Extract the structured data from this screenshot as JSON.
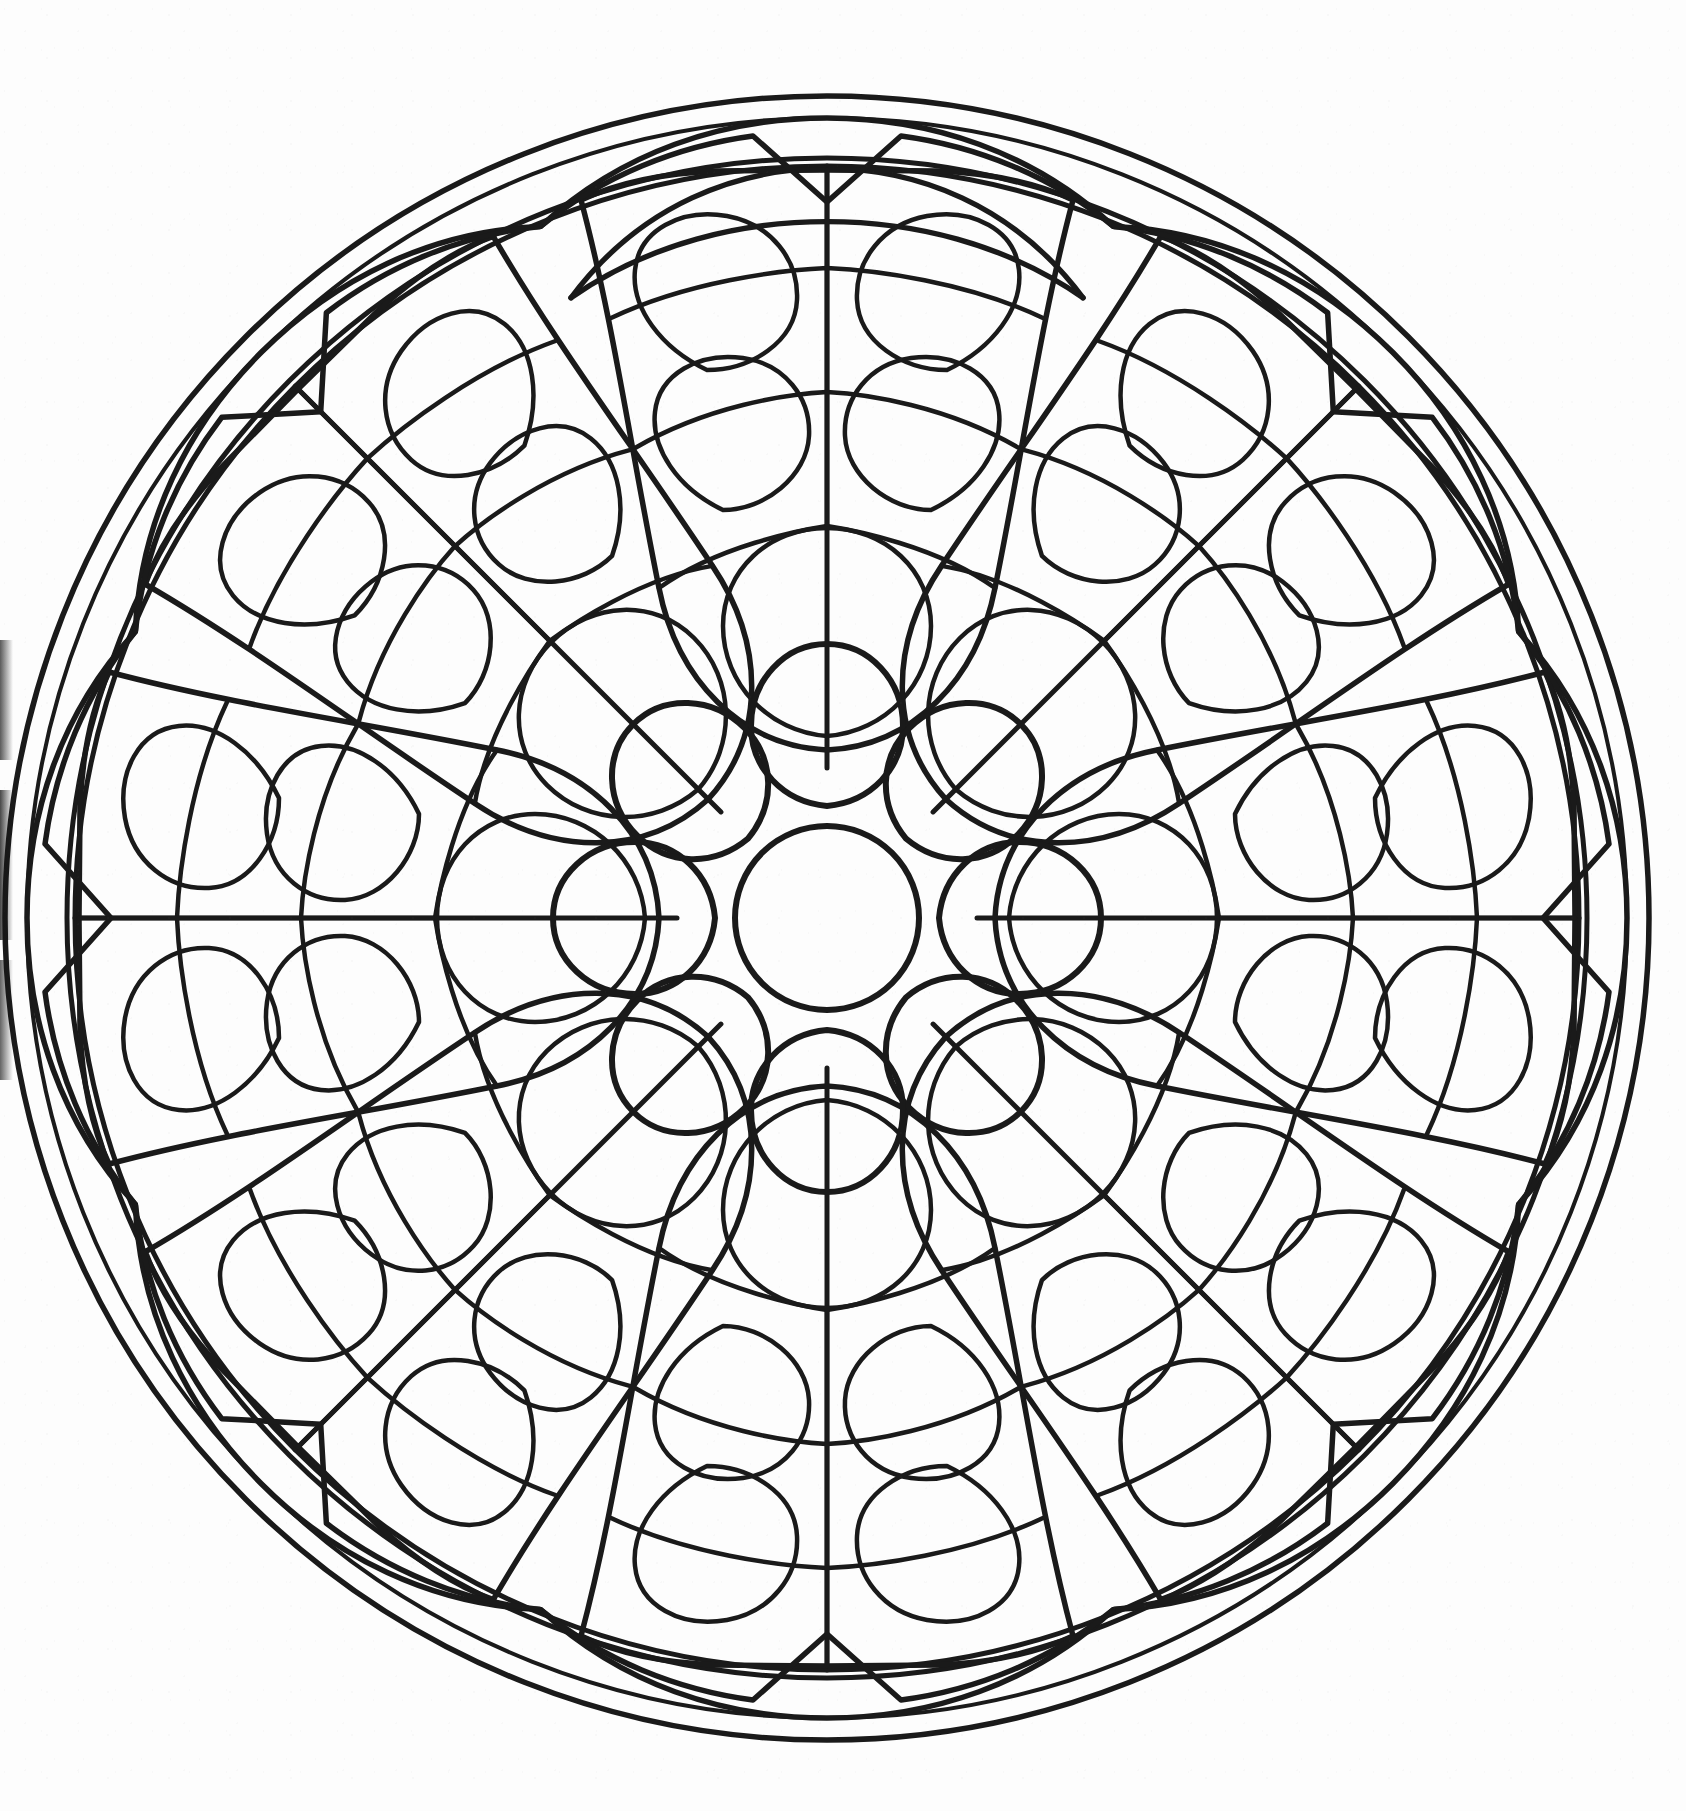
{
  "document": {
    "title": "Rose Window Mandala",
    "type": "line-art-coloring-page",
    "media": "black ink on white paper",
    "page_width": 1686,
    "page_height": 1811,
    "background_color": "#fdfdfd",
    "ink_color": "#1a1a1a"
  },
  "artwork": {
    "name": "gothic-rose-window-mandala",
    "description": "Symmetrical gothic rose window tracery with eight radiating petal wedges, a central rosette, and a cusped outer arcade.",
    "symmetry_order": 8,
    "center_x": 827,
    "center_y": 918,
    "rings": [
      {
        "name": "outer-rim-circle",
        "radius": 822,
        "stroke_width": 5.5
      },
      {
        "name": "outer-inner-circle",
        "radius": 800,
        "stroke_width": 4.0
      },
      {
        "name": "arcade-ring-circle",
        "radius": 760,
        "stroke_width": 5.0
      },
      {
        "name": "main-field-circle",
        "radius": 752,
        "stroke_width": 5.0
      },
      {
        "name": "hub-circle",
        "radius": 92,
        "stroke_width": 6.0
      }
    ],
    "arcade": {
      "name": "cusped-arch-arcade",
      "count": 8,
      "cusp_depth": 82,
      "description": "Eight pointed gothic arches set between the outer rim and the main field, each meeting in a sharp cusp."
    },
    "wedges": {
      "name": "petal-wedges",
      "count": 8,
      "inner_radius": 150,
      "outer_radius": 752,
      "half_angle_deg": 22.5,
      "description": "Eight large teardrop petal wedges radiating from the hub to the main field circle; each subdivided into organic lobes."
    },
    "inner_rosette": {
      "name": "inner-teardrop-ring",
      "count": 8,
      "description": "Eight small teardrops tip-inward around the central hub circle."
    },
    "lobe_pattern": {
      "name": "organic-lobe-fill",
      "lobes_per_wedge": 7,
      "description": "Each wedge is filled with rounded, interlocking pebble-like lobes of varying size."
    },
    "spokes": {
      "name": "radial-spoke-lines",
      "count": 8,
      "angles_deg": [
        0,
        45,
        90,
        135,
        180,
        225,
        270,
        315
      ],
      "description": "Straight radial dividing lines between adjacent petal wedges."
    },
    "palette": {
      "ink": "#1a1a1a",
      "paper": "#fdfdfd",
      "fill": "none"
    }
  },
  "annotations": {
    "binding_shadow_label": "book-spine-shadow",
    "binding_shadow_side": "left"
  }
}
